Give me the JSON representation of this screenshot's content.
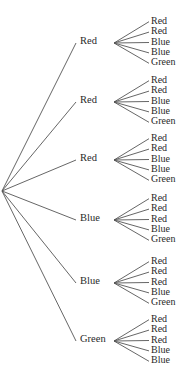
{
  "diagram": {
    "type": "tree",
    "line_color": "#555555",
    "text_color": "#2a2a2a",
    "root": {
      "x": 2,
      "y": 191
    },
    "branches": [
      {
        "label": "Red",
        "y": 42,
        "leaves": [
          "Red",
          "Red",
          "Blue",
          "Blue",
          "Green"
        ]
      },
      {
        "label": "Red",
        "y": 101,
        "leaves": [
          "Red",
          "Red",
          "Blue",
          "Blue",
          "Green"
        ]
      },
      {
        "label": "Red",
        "y": 159,
        "leaves": [
          "Red",
          "Red",
          "Blue",
          "Blue",
          "Green"
        ]
      },
      {
        "label": "Blue",
        "y": 219,
        "leaves": [
          "Red",
          "Red",
          "Red",
          "Blue",
          "Green"
        ]
      },
      {
        "label": "Blue",
        "y": 282,
        "leaves": [
          "Red",
          "Red",
          "Red",
          "Blue",
          "Green"
        ]
      },
      {
        "label": "Green",
        "y": 340,
        "leaves": [
          "Red",
          "Red",
          "Red",
          "Blue",
          "Blue"
        ]
      }
    ]
  }
}
